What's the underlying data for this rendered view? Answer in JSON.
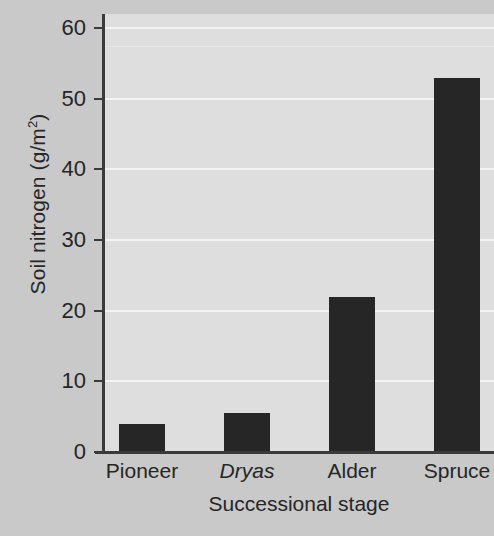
{
  "chart_data": {
    "type": "bar",
    "title": "",
    "xlabel": "Successional stage",
    "ylabel": "Soil nitrogen (g/m2)",
    "ylabel_base": "Soil nitrogen (g/m",
    "ylabel_sup": "2",
    "ylabel_tail": ")",
    "categories": [
      "Pioneer",
      "Dryas",
      "Alder",
      "Spruce"
    ],
    "category_styles": [
      "normal",
      "italic",
      "normal",
      "normal"
    ],
    "values": [
      4,
      5.5,
      22,
      53
    ],
    "ylim": [
      0,
      62
    ],
    "yticks": [
      0,
      10,
      20,
      30,
      40,
      50,
      60
    ],
    "ytick_labels": [
      "0",
      "10",
      "20",
      "30",
      "40",
      "50",
      "60"
    ],
    "grid": true,
    "grid_color": "#f4f4f4",
    "legend": null,
    "bar_color": "#262626",
    "plot_background": "#dedede",
    "figure_background": "#c9c9c9",
    "axis_color": "#3a3a3a"
  }
}
